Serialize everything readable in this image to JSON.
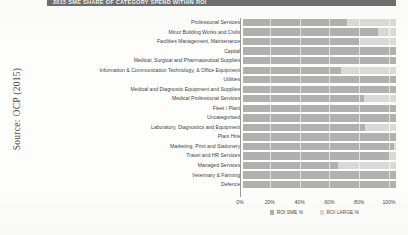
{
  "document": {
    "title": "2015 SME SHARE OF CATEGORY SPEND WITHIN ROI",
    "source_caption": "Source: OCP (2015)"
  },
  "legend": {
    "position": "bottom-center",
    "items": [
      {
        "label": "ROI SME %",
        "color": "#b0b0b0",
        "icon": "legend-swatch-icon"
      },
      {
        "label": "ROI LARGE %",
        "color": "#d9d9d9",
        "icon": "legend-swatch-icon"
      }
    ]
  },
  "axis": {
    "ticks": [
      "0%",
      "20%",
      "40%",
      "60%",
      "80%",
      "100%"
    ],
    "tick_values": [
      0,
      20,
      40,
      60,
      80,
      100
    ]
  },
  "chart_data": {
    "type": "bar",
    "orientation": "horizontal",
    "stacked": true,
    "stack_mode": "percent",
    "title": "2015 SME SHARE OF CATEGORY SPEND WITHIN ROI",
    "xlabel": "",
    "ylabel": "",
    "xlim": [
      0,
      100
    ],
    "grid": true,
    "legend_position": "bottom-center",
    "categories": [
      "Professional Services",
      "Minor Building Works and Civils",
      "Facilities Management, Maintenance",
      "Capital",
      "Medical, Surgical and Pharmaceutical Supplies",
      "Information & Communication Technology, & Office Equipment",
      "Utilities",
      "Medical and Diagnostic Equipment and Supplies",
      "Medical Professional Services",
      "Fleet / Plant",
      "Uncategorised",
      "Laboratory, Diagnostics and Equipment",
      "Plant Hire",
      "Marketing, Print and Stationery",
      "Travel and HR Services",
      "Managed Services",
      "Veterinary & Farming",
      "Defence"
    ],
    "series": [
      {
        "name": "ROI SME %",
        "color": "#b0b0b0",
        "values": [
          68,
          88,
          76,
          100,
          100,
          64,
          100,
          100,
          79,
          100,
          100,
          80,
          100,
          99,
          96,
          62,
          100,
          100
        ]
      },
      {
        "name": "ROI LARGE %",
        "color": "#d9d9d9",
        "values": [
          32,
          12,
          24,
          0,
          0,
          36,
          0,
          0,
          21,
          0,
          0,
          20,
          0,
          1,
          4,
          38,
          0,
          0
        ]
      }
    ]
  }
}
